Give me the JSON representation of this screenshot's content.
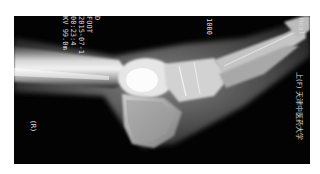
{
  "image": {
    "subject": "lateral foot x-ray",
    "orientation": "rotated 90 degrees",
    "background": "#030303",
    "border": "#ffffff"
  },
  "overlay_text": {
    "top_left_lines": [
      "D",
      "FOOT",
      "2015-07-1",
      "00:23:4",
      "KV 99.0m"
    ],
    "top_middle": "1000",
    "right_edge": "上(F) 天津中医药大学",
    "right_top": "Heal",
    "side_marker": "(R)"
  }
}
